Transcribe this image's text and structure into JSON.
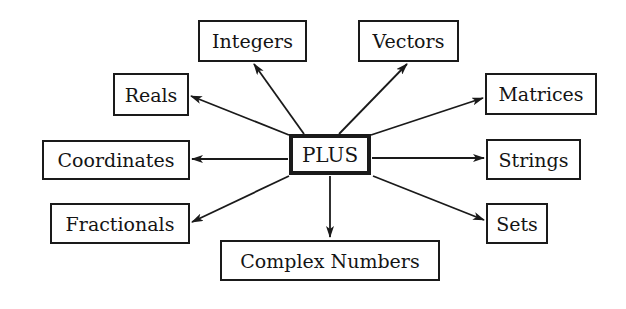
{
  "diagram": {
    "type": "hub-and-spoke",
    "center": {
      "id": "plus",
      "label": "PLUS",
      "box": [
        289,
        134,
        82,
        41
      ]
    },
    "nodes": [
      {
        "id": "integers",
        "label": "Integers",
        "box": [
          198,
          20,
          109,
          42
        ]
      },
      {
        "id": "vectors",
        "label": "Vectors",
        "box": [
          358,
          20,
          101,
          42
        ]
      },
      {
        "id": "reals",
        "label": "Reals",
        "box": [
          113,
          73,
          76,
          43
        ]
      },
      {
        "id": "matrices",
        "label": "Matrices",
        "box": [
          485,
          73,
          112,
          42
        ]
      },
      {
        "id": "coordinates",
        "label": "Coordinates",
        "box": [
          42,
          140,
          148,
          40
        ]
      },
      {
        "id": "strings",
        "label": "Strings",
        "box": [
          486,
          139,
          95,
          41
        ]
      },
      {
        "id": "fractionals",
        "label": "Fractionals",
        "box": [
          50,
          203,
          140,
          41
        ]
      },
      {
        "id": "sets",
        "label": "Sets",
        "box": [
          486,
          203,
          62,
          41
        ]
      },
      {
        "id": "complex",
        "label": "Complex Numbers",
        "box": [
          220,
          240,
          220,
          41
        ]
      }
    ],
    "edges": [
      {
        "from": "plus",
        "to": "integers",
        "x1": 304,
        "y1": 134,
        "x2": 254,
        "y2": 64
      },
      {
        "from": "plus",
        "to": "vectors",
        "x1": 339,
        "y1": 134,
        "x2": 407,
        "y2": 64
      },
      {
        "from": "plus",
        "to": "reals",
        "x1": 289,
        "y1": 135,
        "x2": 191,
        "y2": 96
      },
      {
        "from": "plus",
        "to": "matrices",
        "x1": 371,
        "y1": 135,
        "x2": 483,
        "y2": 98
      },
      {
        "from": "plus",
        "to": "coordinates",
        "x1": 288,
        "y1": 159,
        "x2": 192,
        "y2": 159
      },
      {
        "from": "plus",
        "to": "strings",
        "x1": 372,
        "y1": 158,
        "x2": 484,
        "y2": 158
      },
      {
        "from": "plus",
        "to": "fractionals",
        "x1": 289,
        "y1": 176,
        "x2": 192,
        "y2": 222
      },
      {
        "from": "plus",
        "to": "sets",
        "x1": 373,
        "y1": 176,
        "x2": 484,
        "y2": 220
      },
      {
        "from": "plus",
        "to": "complex",
        "x1": 330,
        "y1": 176,
        "x2": 330,
        "y2": 237
      }
    ],
    "colors": {
      "stroke": "#1a1a1a",
      "text": "#141414",
      "background": "#ffffff"
    }
  }
}
